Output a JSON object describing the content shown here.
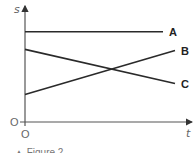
{
  "chart_data": {
    "type": "line",
    "title": "",
    "xlabel": "t",
    "ylabel": "s",
    "xlim": [
      0,
      11
    ],
    "ylim": [
      0,
      10.5
    ],
    "grid": false,
    "x_origin_label": "O",
    "y_origin_label": "O",
    "series": [
      {
        "name": "A",
        "points": [
          [
            0,
            8.2
          ],
          [
            9.2,
            8.2
          ]
        ]
      },
      {
        "name": "B",
        "points": [
          [
            0,
            2.5
          ],
          [
            10,
            6.5
          ]
        ]
      },
      {
        "name": "C",
        "points": [
          [
            0,
            6.6
          ],
          [
            10,
            3.5
          ]
        ]
      }
    ],
    "caption": "▲ Figure 2"
  }
}
